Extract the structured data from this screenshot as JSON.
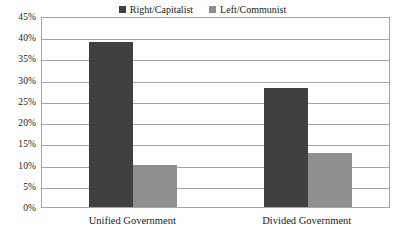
{
  "chart_data": {
    "type": "bar",
    "title": "",
    "subtitle": "",
    "xlabel": "",
    "ylabel": "",
    "categories": [
      "Unified Government",
      "Divided Government"
    ],
    "series": [
      {
        "name": "Right/Capitalist",
        "color": "#404040",
        "values": [
          38.8,
          28.1
        ],
        "value_labels": [
          "38.8%",
          "28.1%"
        ]
      },
      {
        "name": "Left/Communist",
        "color": "#8f8f8f",
        "values": [
          9.8,
          12.7
        ],
        "value_labels": [
          "9.8%",
          "12.7%"
        ]
      }
    ],
    "ylim": [
      0,
      45
    ],
    "ytick_step": 5,
    "ytick_labels": [
      "0%",
      "5%",
      "10%",
      "15%",
      "20%",
      "25%",
      "30%",
      "35%",
      "40%",
      "45%"
    ],
    "ytick_values": [
      0,
      5,
      10,
      15,
      20,
      25,
      30,
      35,
      40,
      45
    ],
    "grid": true,
    "grid_axis": "y",
    "grid_color": "#a6a6a6",
    "legend_position": "top-center",
    "plot_border_color": "#a6a6a6",
    "background_color": "#ffffff",
    "text_color": "#1a1a1a"
  }
}
